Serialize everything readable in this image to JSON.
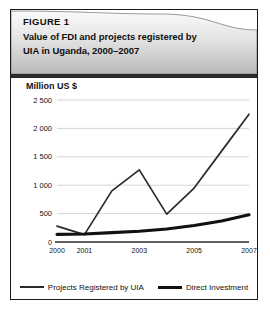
{
  "figure": {
    "label": "FIGURE 1",
    "title_line1": "Value of FDI and projects registered by",
    "title_line2": "UIA in Uganda, 2000–2007"
  },
  "legend": {
    "series1_label": "Projects Registered by UIA",
    "series2_label": "Direct Investment"
  },
  "colors": {
    "header_top": "#f2f2f2",
    "header_bottom": "#bdbdbd",
    "rule": "#2b2b2b",
    "grid": "#c9c9c9",
    "line": "#2b2b2b",
    "border": "#1a1a1a"
  },
  "chart_data": {
    "type": "line",
    "title": "Value of FDI and projects registered by UIA in Uganda, 2000–2007",
    "xlabel": "",
    "ylabel": "Million US $",
    "ylim": [
      0,
      2500
    ],
    "xlim": [
      2000,
      2007
    ],
    "grid": true,
    "legend_position": "bottom",
    "ytick_labels": [
      "2 500",
      "2 000",
      "1 500",
      "1 000",
      "500",
      "0"
    ],
    "ytick_values": [
      2500,
      2000,
      1500,
      1000,
      500,
      0
    ],
    "xtick_labels": [
      "2000",
      "2001",
      "2003",
      "2005",
      "2007"
    ],
    "xtick_values": [
      2000,
      2001,
      2003,
      2005,
      2007
    ],
    "x": [
      2000,
      2001,
      2002,
      2003,
      2004,
      2005,
      2006,
      2007
    ],
    "series": [
      {
        "name": "Projects Registered by UIA",
        "values": [
          280,
          130,
          900,
          1270,
          490,
          950,
          1600,
          2250
        ]
      },
      {
        "name": "Direct Investment",
        "values": [
          135,
          140,
          165,
          190,
          230,
          290,
          370,
          480
        ]
      }
    ]
  }
}
